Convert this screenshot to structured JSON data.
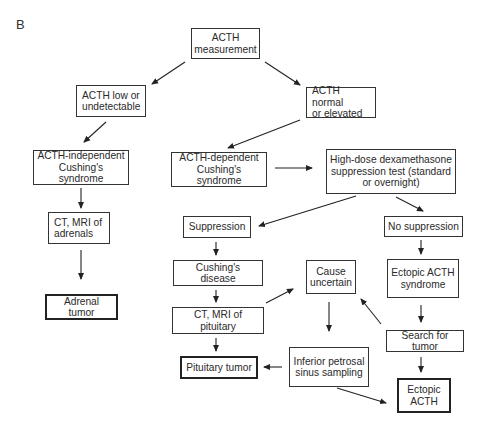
{
  "panel_label": "B",
  "nodes": {
    "acth_measurement": "ACTH\nmeasurement",
    "acth_low": "ACTH low or\nundetectable",
    "acth_normal": "ACTH normal\nor elevated",
    "acth_independent": "ACTH-independent\nCushing's syndrome",
    "ct_mri_adrenals": "CT, MRI of\nadrenals",
    "adrenal_tumor": "Adrenal tumor",
    "acth_dependent": "ACTH-dependent\nCushing's syndrome",
    "dexamethasone_test": "High-dose dexamethasone\nsuppression test (standard\nor overnight)",
    "suppression": "Suppression",
    "no_suppression": "No suppression",
    "cushings_disease": "Cushing's disease",
    "cause_uncertain": "Cause\nuncertain",
    "ectopic_acth_syndrome": "Ectopic ACTH\nsyndrome",
    "ct_mri_pituitary": "CT, MRI of pituitary",
    "search_for_tumor": "Search for tumor",
    "pituitary_tumor": "Pituitary tumor",
    "ipss": "Inferior petrosal\nsinus sampling",
    "ectopic_acth": "Ectopic\nACTH"
  },
  "edges": [
    [
      "acth_measurement",
      "acth_low"
    ],
    [
      "acth_measurement",
      "acth_normal"
    ],
    [
      "acth_low",
      "acth_independent"
    ],
    [
      "acth_normal",
      "acth_dependent"
    ],
    [
      "acth_independent",
      "ct_mri_adrenals"
    ],
    [
      "ct_mri_adrenals",
      "adrenal_tumor"
    ],
    [
      "acth_dependent",
      "dexamethasone_test"
    ],
    [
      "dexamethasone_test",
      "suppression"
    ],
    [
      "dexamethasone_test",
      "no_suppression"
    ],
    [
      "suppression",
      "cushings_disease"
    ],
    [
      "no_suppression",
      "ectopic_acth_syndrome"
    ],
    [
      "cushings_disease",
      "ct_mri_pituitary"
    ],
    [
      "ct_mri_pituitary",
      "cause_uncertain"
    ],
    [
      "ct_mri_pituitary",
      "pituitary_tumor"
    ],
    [
      "ectopic_acth_syndrome",
      "search_for_tumor"
    ],
    [
      "search_for_tumor",
      "cause_uncertain"
    ],
    [
      "search_for_tumor",
      "ectopic_acth"
    ],
    [
      "cause_uncertain",
      "ipss"
    ],
    [
      "ipss",
      "pituitary_tumor"
    ],
    [
      "ipss",
      "ectopic_acth"
    ]
  ],
  "terminal_nodes": [
    "adrenal_tumor",
    "pituitary_tumor",
    "ectopic_acth"
  ]
}
